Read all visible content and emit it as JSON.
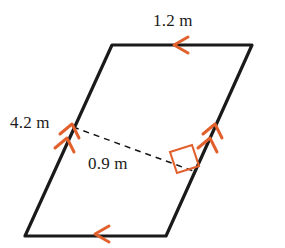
{
  "figure": {
    "kind": "parallelogram-with-height",
    "colors": {
      "outline": "#1a1a1a",
      "tick": "#e2602c",
      "dashed": "#151515",
      "background": "#ffffff",
      "text": "#1b1b1b"
    },
    "vertices": {
      "top_left": {
        "x": 112,
        "y": 45
      },
      "top_right": {
        "x": 252,
        "y": 45
      },
      "bottom_right": {
        "x": 166,
        "y": 236
      },
      "bottom_left": {
        "x": 25,
        "y": 236
      }
    },
    "height_segment": {
      "from": {
        "x": 73,
        "y": 127
      },
      "to": {
        "x": 196,
        "y": 172
      },
      "style": "dashed"
    },
    "labels": {
      "top_side": "1.2 m",
      "left_side": "4.2 m",
      "height": "0.9 m"
    },
    "markers": {
      "top_side_arrows": 1,
      "bottom_side_arrows": 1,
      "left_side_arrows": 2,
      "right_side_arrows": 2,
      "right_angle": true
    }
  }
}
